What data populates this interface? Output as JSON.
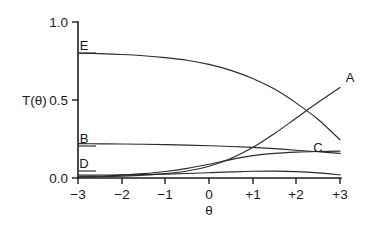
{
  "chart_data": {
    "type": "line",
    "title": "",
    "subtitle": "",
    "xlabel": "θ",
    "ylabel": "T(θ)",
    "xlim": [
      -3,
      3
    ],
    "ylim": [
      0.0,
      1.0
    ],
    "grid": false,
    "legend_position": "inline-curve-labels",
    "x_ticks": [
      -3,
      -2,
      -1,
      0,
      1,
      2,
      3
    ],
    "x_tick_labels": [
      "−3",
      "−2",
      "−1",
      "0",
      "+1",
      "+2",
      "+3"
    ],
    "y_ticks": [
      0.0,
      0.5,
      1.0
    ],
    "y_tick_labels": [
      "0.0",
      "0.5",
      "1.0"
    ],
    "x": [
      -3.0,
      -2.5,
      -2.0,
      -1.5,
      -1.0,
      -0.5,
      0.0,
      0.5,
      1.0,
      1.5,
      2.0,
      2.5,
      3.0
    ],
    "series": [
      {
        "name": "A",
        "label": "A",
        "values": [
          0.005,
          0.008,
          0.012,
          0.018,
          0.028,
          0.045,
          0.075,
          0.125,
          0.195,
          0.285,
          0.385,
          0.485,
          0.58
        ]
      },
      {
        "name": "B",
        "label": "B",
        "values": [
          0.22,
          0.219,
          0.218,
          0.216,
          0.214,
          0.211,
          0.207,
          0.202,
          0.196,
          0.188,
          0.178,
          0.168,
          0.158
        ]
      },
      {
        "name": "C",
        "label": "C",
        "values": [
          0.008,
          0.012,
          0.018,
          0.028,
          0.042,
          0.062,
          0.088,
          0.118,
          0.143,
          0.158,
          0.166,
          0.17,
          0.172
        ]
      },
      {
        "name": "D",
        "label": "D",
        "values": [
          0.018,
          0.019,
          0.02,
          0.022,
          0.025,
          0.029,
          0.034,
          0.039,
          0.043,
          0.044,
          0.041,
          0.033,
          0.02
        ]
      },
      {
        "name": "E",
        "label": "E",
        "values": [
          0.8,
          0.797,
          0.792,
          0.784,
          0.772,
          0.755,
          0.728,
          0.69,
          0.638,
          0.57,
          0.48,
          0.375,
          0.245
        ]
      }
    ],
    "curve_labels": [
      {
        "text": "A",
        "x": 350,
        "y": 82
      },
      {
        "text": "B",
        "x": 84,
        "y": 143
      },
      {
        "text": "C",
        "x": 318,
        "y": 152
      },
      {
        "text": "D",
        "x": 84,
        "y": 168
      },
      {
        "text": "E",
        "x": 84,
        "y": 50
      }
    ]
  }
}
